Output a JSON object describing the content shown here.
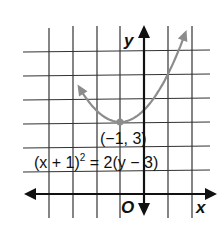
{
  "chart_data": {
    "type": "line",
    "title": "",
    "xlabel": "x",
    "ylabel": "y",
    "origin_label": "O",
    "xlim": [
      -4,
      2
    ],
    "ylim": [
      -1,
      6
    ],
    "grid": true,
    "grid_step": 1,
    "series": [
      {
        "name": "parabola",
        "equation": "(x + 1)^2 = 2(y - 3)",
        "color": "#8c8c8c",
        "x": [
          -4,
          -3.5,
          -3,
          -2.5,
          -2,
          -1.5,
          -1,
          -0.5,
          0,
          0.5,
          1,
          1.5,
          2
        ],
        "y": [
          7.5,
          6.125,
          5,
          4.125,
          3.5,
          3.125,
          3,
          3.125,
          3.5,
          4.125,
          5,
          6.125,
          7.5
        ]
      }
    ],
    "annotations": [
      {
        "text": "(−1, 3)",
        "x": -1,
        "y": 3,
        "type": "vertex"
      },
      {
        "text": "(x + 1)² = 2(y − 3)",
        "type": "equation"
      }
    ]
  },
  "labels": {
    "y_axis": "y",
    "x_axis": "x",
    "origin": "O",
    "vertex": "(−1, 3)",
    "equation_left": "(x + 1)",
    "equation_exp": "2",
    "equation_right": " = 2(y − 3)"
  }
}
